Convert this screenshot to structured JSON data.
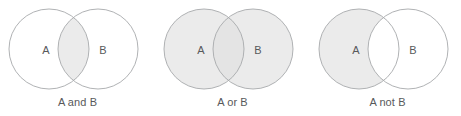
{
  "figure": {
    "type": "venn-diagram-set",
    "background_color": "#ffffff",
    "stroke_color": "#a7a9ac",
    "fill_color": "#ebebeb",
    "fill_color_overlap": "#e2e2e2",
    "text_color": "#58595b",
    "diagram_count": 3
  },
  "diagrams": [
    {
      "id": "a-and-b",
      "caption": "A and B",
      "left_label": "A",
      "right_label": "B",
      "operation": "intersection",
      "shaded_regions": [
        "intersection"
      ],
      "left_circle_filled": false,
      "right_circle_filled": false,
      "intersection_filled": true
    },
    {
      "id": "a-or-b",
      "caption": "A or B",
      "left_label": "A",
      "right_label": "B",
      "operation": "union",
      "shaded_regions": [
        "left-only",
        "intersection",
        "right-only"
      ],
      "left_circle_filled": true,
      "right_circle_filled": true,
      "intersection_filled": true
    },
    {
      "id": "a-not-b",
      "caption": "A not B",
      "left_label": "A",
      "right_label": "B",
      "operation": "difference",
      "shaded_regions": [
        "left-only"
      ],
      "left_circle_filled": true,
      "right_circle_filled": false,
      "intersection_filled": false
    }
  ]
}
